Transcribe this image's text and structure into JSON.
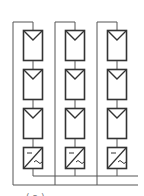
{
  "diagram": {
    "stroke_color": "#333333",
    "line_color": "#555555",
    "columns": [
      {
        "name": "string-1",
        "loop_x": 13,
        "box_x": 23
      },
      {
        "name": "string-2",
        "loop_x": 55,
        "box_x": 65
      },
      {
        "name": "string-3",
        "loop_x": 97,
        "box_x": 107
      }
    ],
    "box_width": 20,
    "panel_rows": [
      {
        "y": 30,
        "h": 30
      },
      {
        "y": 69,
        "h": 30
      },
      {
        "y": 108,
        "h": 30
      }
    ],
    "inverter_row": {
      "y": 147,
      "h": 21,
      "dc_symbol": "—",
      "ac_symbol": "~"
    },
    "loop_top_y": 22,
    "bus_lines": [
      {
        "y": 176,
        "x1": 33,
        "x2": 138
      },
      {
        "y": 185,
        "x1": 13,
        "x2": 138
      }
    ]
  },
  "caption": {
    "text": "(a)  ·  ·  ·  ·  ·  ·"
  }
}
